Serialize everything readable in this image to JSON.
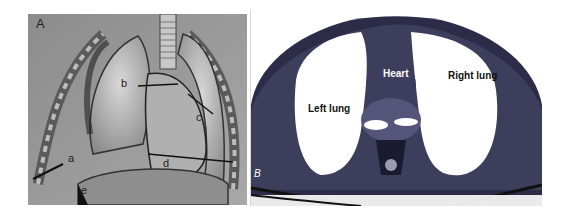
{
  "figure": {
    "panel_a": {
      "label": "A",
      "description": "Anatomical illustration of thoracic cavity with lungs and heart",
      "annotations": [
        "a",
        "b",
        "c",
        "d",
        "e"
      ]
    },
    "panel_b": {
      "label": "B",
      "description": "Axial chest CT scan",
      "annotations": {
        "heart": "Heart",
        "left_lung": "Left lung",
        "right_lung": "Right lung"
      }
    }
  }
}
